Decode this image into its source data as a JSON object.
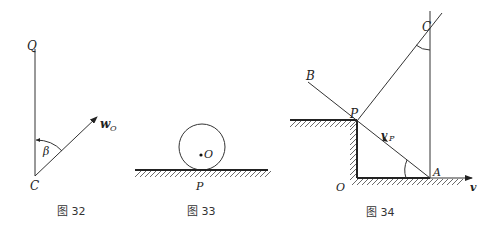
{
  "figures": [
    {
      "caption": "图 32",
      "labels": {
        "top_point": "Q",
        "bottom_point": "C",
        "angle": "β",
        "vector": "w",
        "vector_sub": "O"
      }
    },
    {
      "caption": "图 33",
      "labels": {
        "center": "O",
        "contact": "P"
      }
    },
    {
      "caption": "图 34",
      "labels": {
        "B": "B",
        "P": "P",
        "C": "C",
        "A": "A",
        "O": "O",
        "velocity": "v",
        "vp": "v",
        "vp_sub": "P"
      }
    }
  ]
}
